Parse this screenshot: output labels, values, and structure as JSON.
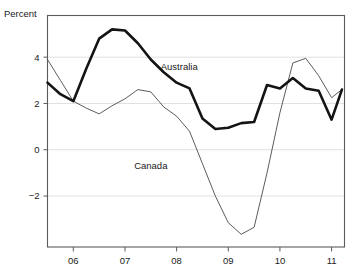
{
  "chart_data": {
    "type": "line",
    "title": "",
    "subtitle": "",
    "xlabel": "",
    "ylabel": "Percent",
    "ylim": [
      -4.2,
      5.8
    ],
    "xlim": [
      2005.5,
      2011.25
    ],
    "grid": true,
    "gridlines": [
      4,
      2,
      0,
      -2
    ],
    "yticks": [
      4,
      2,
      0,
      -2
    ],
    "ytick_labels": [
      "4",
      "2",
      "0",
      "−2"
    ],
    "xticks": [
      2006,
      2007,
      2008,
      2009,
      2010,
      2011
    ],
    "xtick_labels": [
      "06",
      "07",
      "08",
      "09",
      "10",
      "11"
    ],
    "legend_position": "inline-annotation",
    "annotations": [
      {
        "text": "Australia",
        "x": 2008.05,
        "y": 3.45
      },
      {
        "text": "Canada",
        "x": 2007.5,
        "y": -0.85
      }
    ],
    "x": [
      2005.5,
      2005.75,
      2006.0,
      2006.25,
      2006.5,
      2006.75,
      2007.0,
      2007.25,
      2007.5,
      2007.75,
      2008.0,
      2008.25,
      2008.5,
      2008.75,
      2009.0,
      2009.25,
      2009.5,
      2009.75,
      2010.0,
      2010.25,
      2010.5,
      2010.75,
      2011.0,
      2011.2
    ],
    "series": [
      {
        "name": "Australia",
        "style": "bold",
        "color": "#141414",
        "width": 2.6,
        "values": [
          2.9,
          2.4,
          2.1,
          3.5,
          4.8,
          5.2,
          5.15,
          4.6,
          3.9,
          3.35,
          2.9,
          2.65,
          1.35,
          0.9,
          0.95,
          1.15,
          1.2,
          2.8,
          2.65,
          3.1,
          2.65,
          2.55,
          1.3,
          2.6
        ]
      },
      {
        "name": "Canada",
        "style": "thin",
        "color": "#4a4a4a",
        "width": 0.9,
        "values": [
          3.9,
          3.0,
          2.1,
          1.8,
          1.55,
          1.9,
          2.2,
          2.6,
          2.5,
          1.85,
          1.45,
          0.8,
          -0.6,
          -2.0,
          -3.15,
          -3.65,
          -3.35,
          -1.0,
          1.6,
          3.75,
          3.95,
          3.2,
          2.25,
          2.6
        ]
      }
    ]
  },
  "labels": {
    "y_axis_title": "Percent"
  }
}
